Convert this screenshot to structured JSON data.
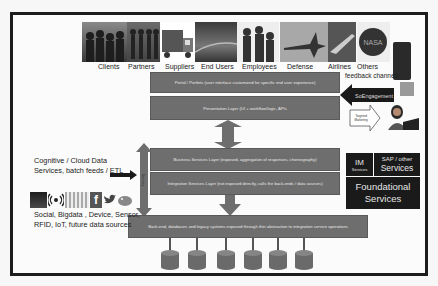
{
  "stakeholders": [
    {
      "label": "Clients",
      "icon": "people-group-icon"
    },
    {
      "label": "Partners",
      "icon": "people-silhouettes-icon"
    },
    {
      "label": "Suppliers",
      "icon": "delivery-truck-icon"
    },
    {
      "label": "End Users",
      "icon": "highway-icon"
    },
    {
      "label": "Employees",
      "icon": "business-people-icon"
    },
    {
      "label": "Defense",
      "icon": "fighter-jet-icon"
    },
    {
      "label": "Airlines",
      "icon": "airplane-icon"
    },
    {
      "label": "Others",
      "icon": "nasa-logo-icon"
    }
  ],
  "feedback_label": "feedback channels",
  "layers": {
    "portal": "Portal / Portlets (user interface customized for specific end user experience)",
    "presentation": "Presentation Layer (UI + workflow/logic, APIs",
    "business": "Business Services Layer (exposed, aggregation of responses, choreography)",
    "integration": "Integration Services Layer (not exposed directly, calls the back-ends / data sources)",
    "backend": "Back-end, databases and legacy systems exposed through thin abstraction to integration service operations"
  },
  "side_arrow_label": "Security",
  "soengagement": "SoEngagement",
  "targeted_marketing": "Targeted Marketing",
  "im_services": {
    "title": "IM",
    "subtitle": "Services"
  },
  "sap_services": {
    "line1": "SAP / other",
    "line2": "Services"
  },
  "foundational": {
    "line1": "Foundational",
    "line2": "Services"
  },
  "left_top_text": {
    "line1": "Cognitive / Cloud  Data",
    "line2": "Services, batch feeds / ETL"
  },
  "left_bottom_text": {
    "line1": "Social, Bigdata , Device, Sensor,",
    "line2": "RFID, IoT, future data sources"
  },
  "source_icons": [
    "bigdata-chart-icon",
    "wireless-sensor-icon",
    "map-visualization-icon",
    "facebook-icon",
    "twitter-icon",
    "hadoop-elephant-icon"
  ],
  "databases_count": 6,
  "colors": {
    "layer_fill": "#6e6e6e",
    "dark_box": "#1a1a1a",
    "frame": "#1c1c1c",
    "background": "#fbfbfb"
  }
}
